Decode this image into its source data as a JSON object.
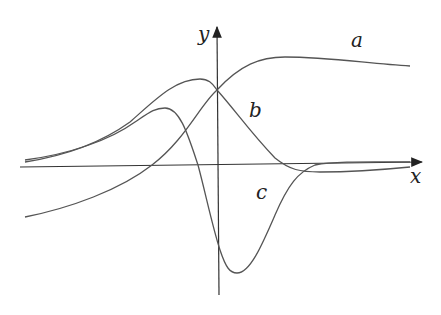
{
  "figure": {
    "axes": {
      "x_label": "x",
      "y_label": "y"
    },
    "curves": [
      {
        "label": "a",
        "color": "#555555",
        "path": "M25,217 C70,208 120,190 152,165 C185,140 200,105 217,90 C240,65 260,57 285,57 C330,57 370,64 410,66"
      },
      {
        "label": "b",
        "color": "#555555",
        "path": "M25,162 C70,155 105,140 130,122 C155,100 175,79 200,79 C210,79 213,85 217,90 C235,110 250,132 275,158 C290,170 300,172 320,172 C360,172 390,169 410,167"
      },
      {
        "label": "c",
        "color": "#555555",
        "path": "M25,160 C70,154 110,140 135,122 C150,112 155,108 165,108 C180,108 188,135 198,165 C206,195 212,225 220,250 C226,268 230,273 237,273 C250,273 262,245 275,215 C288,185 298,172 315,165 C335,161 370,162 410,162"
      }
    ]
  }
}
